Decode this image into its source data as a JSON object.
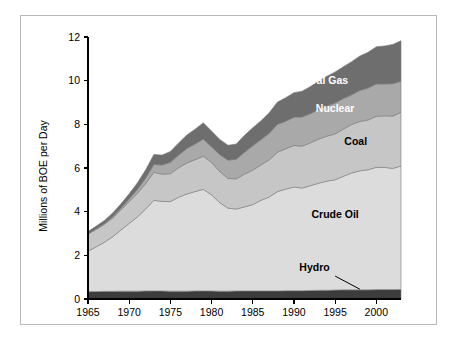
{
  "chart_data": {
    "type": "area",
    "title": "",
    "subtitle": "",
    "xlabel": "",
    "ylabel": "Millions of BOE per Day",
    "xlim": [
      1965,
      2003
    ],
    "ylim": [
      0,
      12
    ],
    "ytick_labels": [
      "0",
      "2",
      "4",
      "6",
      "8",
      "10",
      "12"
    ],
    "ytick_values": [
      0,
      2,
      4,
      6,
      8,
      10,
      12
    ],
    "xtick_labels": [
      "1965",
      "1970",
      "1975",
      "1980",
      "1985",
      "1990",
      "1995",
      "2000"
    ],
    "xtick_values": [
      1965,
      1970,
      1975,
      1980,
      1985,
      1990,
      1995,
      2000
    ],
    "grid": false,
    "legend_position": "inline-labels",
    "stacked": true,
    "x": [
      1965,
      1966,
      1967,
      1968,
      1969,
      1970,
      1971,
      1972,
      1973,
      1974,
      1975,
      1976,
      1977,
      1978,
      1979,
      1980,
      1981,
      1982,
      1983,
      1984,
      1985,
      1986,
      1987,
      1988,
      1989,
      1990,
      1991,
      1992,
      1993,
      1994,
      1995,
      1996,
      1997,
      1998,
      1999,
      2000,
      2001,
      2002,
      2003
    ],
    "series": [
      {
        "name": "Hydro",
        "color": "#3c3c3c",
        "label_color": "#000000",
        "values": [
          0.34,
          0.34,
          0.35,
          0.35,
          0.36,
          0.36,
          0.36,
          0.37,
          0.37,
          0.37,
          0.36,
          0.36,
          0.36,
          0.37,
          0.37,
          0.37,
          0.36,
          0.36,
          0.37,
          0.37,
          0.37,
          0.37,
          0.37,
          0.37,
          0.38,
          0.38,
          0.38,
          0.39,
          0.4,
          0.4,
          0.41,
          0.42,
          0.42,
          0.42,
          0.42,
          0.43,
          0.43,
          0.43,
          0.44
        ]
      },
      {
        "name": "Crude Oil",
        "color": "#dcdcdc",
        "label_color": "#000000",
        "values": [
          1.85,
          2.05,
          2.25,
          2.5,
          2.8,
          3.1,
          3.4,
          3.75,
          4.15,
          4.1,
          4.1,
          4.3,
          4.45,
          4.55,
          4.65,
          4.4,
          4.05,
          3.8,
          3.75,
          3.85,
          3.95,
          4.15,
          4.3,
          4.55,
          4.65,
          4.75,
          4.7,
          4.8,
          4.9,
          5.0,
          5.05,
          5.2,
          5.35,
          5.45,
          5.5,
          5.6,
          5.6,
          5.55,
          5.65
        ]
      },
      {
        "name": "Coal",
        "color": "#c6c6c6",
        "label_color": "#000000",
        "values": [
          0.78,
          0.8,
          0.82,
          0.86,
          0.92,
          1.0,
          1.08,
          1.16,
          1.28,
          1.25,
          1.28,
          1.35,
          1.42,
          1.46,
          1.52,
          1.48,
          1.42,
          1.36,
          1.38,
          1.5,
          1.58,
          1.62,
          1.7,
          1.8,
          1.85,
          1.9,
          1.92,
          1.96,
          2.02,
          2.06,
          2.1,
          2.16,
          2.22,
          2.26,
          2.28,
          2.34,
          2.36,
          2.4,
          2.46
        ]
      },
      {
        "name": "Nuclear",
        "color": "#a9a9a9",
        "label_color": "#ffffff",
        "values": [
          0.02,
          0.03,
          0.04,
          0.06,
          0.08,
          0.12,
          0.18,
          0.26,
          0.36,
          0.42,
          0.52,
          0.58,
          0.66,
          0.72,
          0.78,
          0.72,
          0.78,
          0.84,
          0.9,
          1.0,
          1.12,
          1.16,
          1.22,
          1.28,
          1.26,
          1.3,
          1.34,
          1.34,
          1.36,
          1.38,
          1.42,
          1.4,
          1.36,
          1.42,
          1.46,
          1.48,
          1.46,
          1.48,
          1.42
        ]
      },
      {
        "name": "Natural Gas",
        "color": "#6e6e6e",
        "label_color": "#ffffff",
        "values": [
          0.1,
          0.12,
          0.14,
          0.17,
          0.2,
          0.24,
          0.3,
          0.38,
          0.46,
          0.45,
          0.5,
          0.56,
          0.62,
          0.68,
          0.75,
          0.72,
          0.7,
          0.68,
          0.7,
          0.78,
          0.82,
          0.86,
          0.94,
          1.02,
          1.08,
          1.12,
          1.18,
          1.24,
          1.3,
          1.36,
          1.42,
          1.46,
          1.52,
          1.58,
          1.64,
          1.7,
          1.74,
          1.8,
          1.86
        ]
      }
    ],
    "annotations": [
      {
        "name": "natural-gas-label",
        "text": "Natural Gas",
        "x": 1993.0,
        "y": 9.85,
        "color": "#ffffff"
      },
      {
        "name": "nuclear-label",
        "text": "Nuclear",
        "x": 1995.0,
        "y": 8.55,
        "color": "#ffffff"
      },
      {
        "name": "coal-label",
        "text": "Coal",
        "x": 1997.5,
        "y": 7.05,
        "color": "#000000"
      },
      {
        "name": "crude-oil-label",
        "text": "Crude Oil",
        "x": 1995.0,
        "y": 3.7,
        "color": "#000000"
      },
      {
        "name": "hydro-label",
        "text": "Hydro",
        "x": 1992.5,
        "y": 1.3,
        "color": "#000000"
      }
    ],
    "hydro_leader": {
      "name": "hydro-leader-line",
      "x1": 1995.0,
      "y1": 1.05,
      "x2": 1998.0,
      "y2": 0.45
    }
  }
}
